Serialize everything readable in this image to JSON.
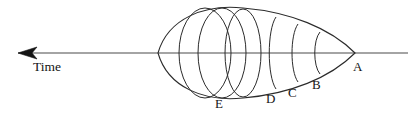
{
  "figure": {
    "type": "diagram",
    "background_color": "#ffffff",
    "stroke_color": "#2b2b2b",
    "axis_color": "#4a4a4a",
    "text_color": "#141414",
    "width": 418,
    "height": 122
  },
  "axis": {
    "name": "time-axis",
    "label": "Time",
    "direction": "left",
    "arrow_tip_x": 18,
    "line_y": 53,
    "line_start_x": 18,
    "line_end_x": 408,
    "label_x": 33,
    "label_y": 66
  },
  "cone": {
    "apex_x": 355,
    "apex_y": 53,
    "tail_left_x": 158,
    "top_y": 7,
    "bottom_y": 97
  },
  "sections": [
    {
      "label": "A",
      "name": "section-a",
      "kind": "apex",
      "center_x": 355,
      "rx": 0,
      "ry": 0,
      "label_x": 353,
      "label_y": 66
    },
    {
      "label": "B",
      "name": "section-b",
      "kind": "arc",
      "center_x": 320,
      "rx": 9,
      "ry": 21,
      "label_x": 312,
      "label_y": 84
    },
    {
      "label": "C",
      "name": "section-c",
      "kind": "arc",
      "center_x": 298,
      "rx": 12,
      "ry": 29,
      "label_x": 288,
      "label_y": 92
    },
    {
      "label": "D",
      "name": "section-d",
      "kind": "arc",
      "center_x": 276,
      "rx": 15,
      "ry": 36,
      "label_x": 266,
      "label_y": 98
    },
    {
      "label": "E",
      "name": "section-e",
      "kind": "ellipse",
      "center_x": 243,
      "rx": 18,
      "ry": 44,
      "label_x": 215,
      "label_y": 103
    }
  ],
  "inner_ellipses": [
    {
      "name": "inner-ellipse-1",
      "center_x": 222,
      "rx": 24,
      "ry": 45
    },
    {
      "name": "inner-ellipse-2",
      "center_x": 205,
      "rx": 26,
      "ry": 45
    }
  ],
  "labels": {
    "time": "Time",
    "a": "A",
    "b": "B",
    "c": "C",
    "d": "D",
    "e": "E"
  }
}
